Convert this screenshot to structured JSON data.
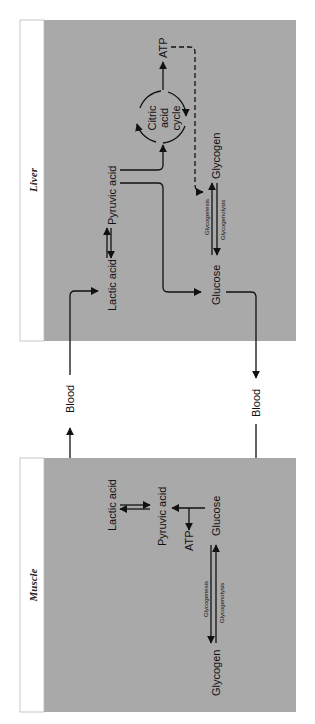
{
  "colors": {
    "panel_fill": "#a9a9a9",
    "label_strip": "#ffffff",
    "ink": "#111111",
    "background": "#ffffff"
  },
  "orientation": "rotated-90-clockwise",
  "panels": {
    "liver": {
      "title": "Liver",
      "nodes": {
        "lactic_acid": "Lactic acid",
        "pyruvic_acid": "Pyruvic acid",
        "citric_line1": "Citric",
        "citric_line2": "acid",
        "citric_line3": "cycle",
        "atp": "ATP",
        "glycogen": "Glycogen",
        "glucose": "Glucose",
        "glycogenesis": "Glycogenesis",
        "glycogenolysis": "Glycogenolysis"
      }
    },
    "muscle": {
      "title": "Muscle",
      "nodes": {
        "lactic_acid": "Lactic acid",
        "pyruvic_acid": "Pyruvic acid",
        "glucose": "Glucose",
        "atp": "ATP",
        "glycogen": "Glycogen",
        "glycogenesis": "Glycogenesis",
        "glycogenolysis": "Glycogenolysis"
      }
    }
  },
  "transport": {
    "blood_to_liver": "Blood",
    "blood_to_muscle": "Blood"
  }
}
